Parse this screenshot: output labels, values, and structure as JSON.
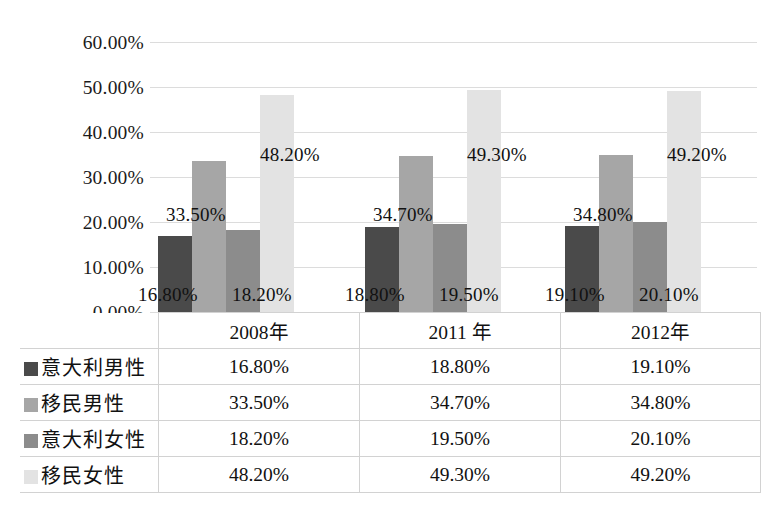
{
  "chart_data": {
    "type": "bar",
    "title": "",
    "subtitle": "",
    "xlabel": "",
    "ylabel": "",
    "categories": [
      "2008年",
      "2011 年",
      "2012年"
    ],
    "series": [
      {
        "name": "意大利男性",
        "color": "#4a4a4a",
        "values": [
          16.8,
          18.8,
          19.1
        ],
        "labels": [
          "16.80%",
          "18.80%",
          "19.10%"
        ]
      },
      {
        "name": "移民男性",
        "color": "#a6a6a6",
        "values": [
          33.5,
          34.7,
          34.8
        ],
        "labels": [
          "33.50%",
          "34.70%",
          "34.80%"
        ]
      },
      {
        "name": "意大利女性",
        "color": "#8c8c8c",
        "values": [
          18.2,
          19.5,
          20.1
        ],
        "labels": [
          "18.20%",
          "19.50%",
          "20.10%"
        ]
      },
      {
        "name": "移民女性",
        "color": "#e3e3e3",
        "values": [
          48.2,
          49.3,
          49.2
        ],
        "labels": [
          "48.20%",
          "49.30%",
          "49.20%"
        ]
      }
    ],
    "ylim": [
      0,
      60
    ],
    "ytick_values": [
      60,
      50,
      40,
      30,
      20,
      10,
      0
    ],
    "ytick_labels": [
      "60.00%",
      "50.00%",
      "40.00%",
      "30.00%",
      "20.00%",
      "10.00%",
      "0.00%"
    ],
    "grid": true,
    "legend_position": "table-below",
    "data_labels_shown": true
  },
  "table": {
    "corner_label": "",
    "column_headers": [
      "2008年",
      "2011 年",
      "2012年"
    ],
    "rows": [
      {
        "series": "意大利男性",
        "swatch_color": "#4a4a4a",
        "values": [
          "16.80%",
          "18.80%",
          "19.10%"
        ]
      },
      {
        "series": "移民男性",
        "swatch_color": "#a6a6a6",
        "values": [
          "33.50%",
          "34.70%",
          "34.80%"
        ]
      },
      {
        "series": "意大利女性",
        "swatch_color": "#8c8c8c",
        "values": [
          "18.20%",
          "19.50%",
          "20.10%"
        ]
      },
      {
        "series": "移民女性",
        "swatch_color": "#e3e3e3",
        "values": [
          "48.20%",
          "49.30%",
          "49.20%"
        ]
      }
    ]
  },
  "style": {
    "background": "#ffffff",
    "gridline_color": "#dcdcdc",
    "table_border_color": "#d2d2d2",
    "text_color": "#111111"
  }
}
